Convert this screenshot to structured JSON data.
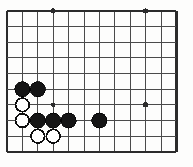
{
  "figure": {
    "kind": "go-board-diagram",
    "board": {
      "columns": 12,
      "rows": 10,
      "origin_x": 7,
      "origin_y": 11,
      "spacing_x": 15.4,
      "spacing_y": 15.65,
      "line_color": "#4a4a4a",
      "edge_color": "#2b2b2b",
      "background_color": "#fdfdfc",
      "line_width": 1,
      "edge_width": 2.2,
      "edge_sides": [
        "left",
        "top",
        "right",
        "bottom"
      ]
    },
    "star_points": [
      {
        "col": 4,
        "row": 1,
        "radius": 2.6
      },
      {
        "col": 10,
        "row": 1,
        "radius": 2.6
      },
      {
        "col": 4,
        "row": 7,
        "radius": 2.2
      },
      {
        "col": 10,
        "row": 7,
        "radius": 2.6
      }
    ],
    "stone_radius": 7.6,
    "stones": [
      {
        "color": "black",
        "col": 2,
        "row": 6
      },
      {
        "color": "black",
        "col": 3,
        "row": 6
      },
      {
        "color": "white",
        "col": 2,
        "row": 7
      },
      {
        "color": "white",
        "col": 2,
        "row": 8
      },
      {
        "color": "black",
        "col": 3,
        "row": 8
      },
      {
        "color": "black",
        "col": 4,
        "row": 8
      },
      {
        "color": "black",
        "col": 5,
        "row": 8
      },
      {
        "color": "black",
        "col": 7,
        "row": 8
      },
      {
        "color": "white",
        "col": 3,
        "row": 9
      },
      {
        "color": "white",
        "col": 4,
        "row": 9
      }
    ],
    "counts": {
      "black_stones": "6",
      "white_stones": "4",
      "total_stones": "10"
    },
    "colors": {
      "black_stone": "#151515",
      "white_stone": "#ffffff",
      "white_stone_outline": "#0e0e0e",
      "grid_line": "#4a4a4a",
      "board_edge": "#2b2b2b"
    }
  }
}
